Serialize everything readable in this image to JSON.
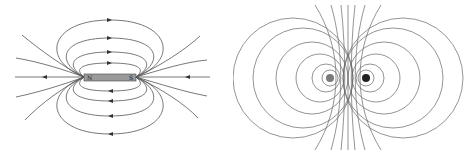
{
  "diagram": {
    "left_panel": {
      "subject": "bar-magnet-field-lines",
      "magnet": {
        "north_label": "N",
        "south_label": "S",
        "color": "#9a9a9a"
      },
      "line_color": "#555555"
    },
    "right_panel": {
      "subject": "current-loop-cross-section-field-lines",
      "conductors": [
        {
          "side": "left",
          "color": "#7a7a7a"
        },
        {
          "side": "right",
          "color": "#222222"
        }
      ],
      "line_color": "#666666"
    }
  }
}
